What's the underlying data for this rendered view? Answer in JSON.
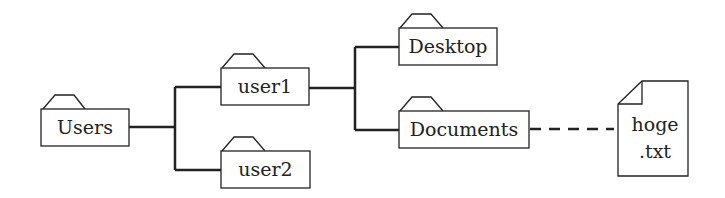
{
  "diagram": {
    "type": "directory-tree",
    "nodes": [
      {
        "id": "users",
        "label": "Users",
        "kind": "folder"
      },
      {
        "id": "user1",
        "label": "user1",
        "kind": "folder"
      },
      {
        "id": "user2",
        "label": "user2",
        "kind": "folder"
      },
      {
        "id": "desktop",
        "label": "Desktop",
        "kind": "folder"
      },
      {
        "id": "documents",
        "label": "Documents",
        "kind": "folder"
      },
      {
        "id": "hoge",
        "label_line1": "hoge",
        "label_line2": ".txt",
        "kind": "file"
      }
    ],
    "edges": [
      {
        "from": "users",
        "to": "user1",
        "style": "solid"
      },
      {
        "from": "users",
        "to": "user2",
        "style": "solid"
      },
      {
        "from": "user1",
        "to": "desktop",
        "style": "solid"
      },
      {
        "from": "user1",
        "to": "documents",
        "style": "solid"
      },
      {
        "from": "documents",
        "to": "hoge",
        "style": "dashed"
      }
    ],
    "colors": {
      "stroke": "#222222",
      "fill": "#ffffff"
    }
  }
}
